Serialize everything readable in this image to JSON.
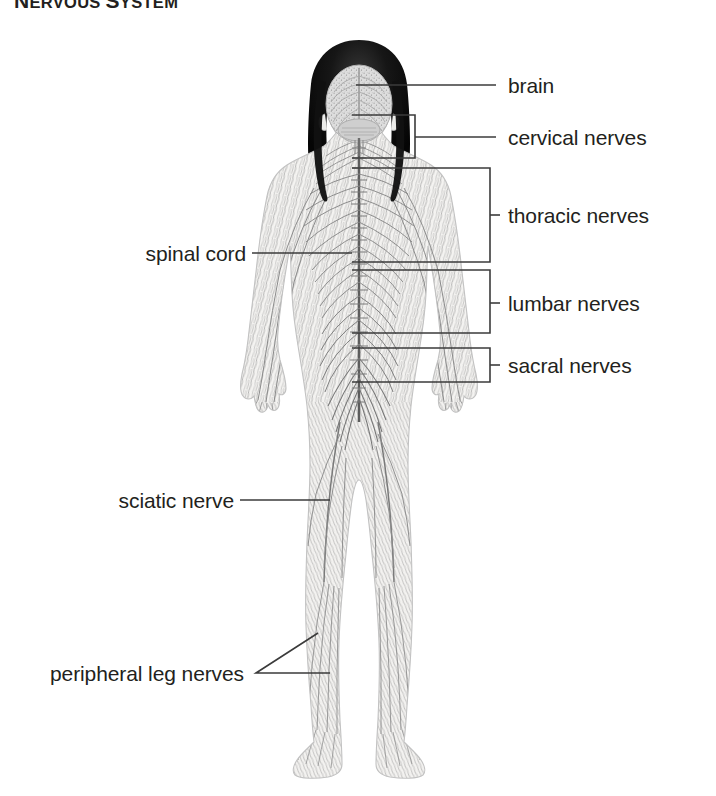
{
  "title": {
    "lead_cap": "N",
    "lead_rest": "ERVOUS ",
    "second_cap": "S",
    "second_rest": "YSTEM"
  },
  "figure": {
    "name": "human-nervous-system-posterior-view",
    "colors": {
      "nerve_ink": "#8d8d8d",
      "nerve_dark": "#6f6f6f",
      "skin_fill": "#f2f1ef",
      "hair": "#141414",
      "brain_fill": "#d9d9d9",
      "leader_line": "#3b3b3b",
      "text": "#231f20",
      "background": "#ffffff"
    }
  },
  "callouts": [
    {
      "id": "brain",
      "label": "brain",
      "connector": "line",
      "side": "right",
      "label_x": 508,
      "label_y": 75
    },
    {
      "id": "cervical-nerves",
      "label": "cervical nerves",
      "connector": "bracket",
      "side": "right",
      "label_x": 508,
      "label_y": 129
    },
    {
      "id": "thoracic-nerves",
      "label": "thoracic nerves",
      "connector": "bracket",
      "side": "right",
      "label_x": 508,
      "label_y": 208
    },
    {
      "id": "lumbar-nerves",
      "label": "lumbar nerves",
      "connector": "bracket",
      "side": "right",
      "label_x": 508,
      "label_y": 297
    },
    {
      "id": "sacral-nerves",
      "label": "sacral nerves",
      "connector": "bracket",
      "side": "right",
      "label_x": 508,
      "label_y": 359
    },
    {
      "id": "spinal-cord",
      "label": "spinal cord",
      "connector": "line",
      "side": "left",
      "label_x": 124,
      "label_y": 246
    },
    {
      "id": "sciatic-nerve",
      "label": "sciatic nerve",
      "connector": "line",
      "side": "left",
      "label_x": 107,
      "label_y": 497
    },
    {
      "id": "peripheral-leg-nerves",
      "label": "peripheral leg nerves",
      "connector": "fork",
      "side": "left",
      "label_x": 12,
      "label_y": 650
    }
  ]
}
